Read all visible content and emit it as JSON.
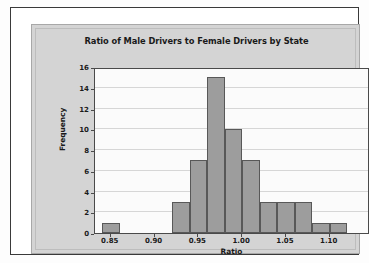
{
  "chart_data": {
    "type": "bar",
    "title": "Ratio of Male Drivers to Female Drivers by State",
    "xlabel": "Ratio",
    "ylabel": "Frequency",
    "xlim": [
      0.832,
      1.146
    ],
    "ylim": [
      0,
      16
    ],
    "grid": true,
    "legend": false,
    "bin_width": 0.02,
    "x_tick_labels": [
      "0.85",
      "0.90",
      "0.95",
      "1.00",
      "1.05",
      "1.10"
    ],
    "x_tick_values": [
      0.85,
      0.9,
      0.95,
      1.0,
      1.05,
      1.1
    ],
    "y_tick_labels": [
      "0",
      "2",
      "4",
      "6",
      "8",
      "10",
      "12",
      "14",
      "16"
    ],
    "y_tick_values": [
      0,
      2,
      4,
      6,
      8,
      10,
      12,
      14,
      16
    ],
    "categories": [
      "0.84-0.86",
      "0.86-0.88",
      "0.88-0.90",
      "0.90-0.92",
      "0.92-0.94",
      "0.94-0.96",
      "0.96-0.98",
      "0.98-1.00",
      "1.00-1.02",
      "1.02-1.04",
      "1.04-1.06",
      "1.06-1.08",
      "1.08-1.10",
      "1.10-1.12",
      "1.12-1.14"
    ],
    "bin_starts": [
      0.84,
      0.86,
      0.88,
      0.9,
      0.92,
      0.94,
      0.96,
      0.98,
      1.0,
      1.02,
      1.04,
      1.06,
      1.08,
      1.1,
      1.12
    ],
    "values": [
      1,
      0,
      0,
      0,
      3,
      7,
      15,
      10,
      7,
      3,
      3,
      3,
      1,
      1,
      0
    ],
    "colors": {
      "bar_fill": "#9d9d9d",
      "bar_edge": "#585858",
      "plot_background": "#fbfbfb",
      "panel_background": "#d4d4d4",
      "axis": "#4a4a4a",
      "gridline": "#c9c9c9",
      "text": "#1a1a1a",
      "outer_frame": "#3a3a3a"
    }
  }
}
